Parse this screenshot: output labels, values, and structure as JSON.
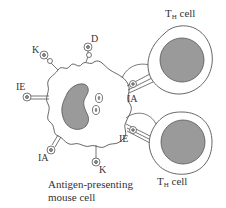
{
  "diagram": {
    "apc_caption_line1": "Antigen-presenting",
    "apc_caption_line2": "mouse cell",
    "th_cell_top": {
      "main": "T",
      "sub": "H",
      "suffix": " cell"
    },
    "th_cell_bottom": {
      "main": "T",
      "sub": "H",
      "suffix": " cell"
    },
    "molecule_labels": {
      "k_top": "K",
      "d_top": "D",
      "ie_left": "IE",
      "ia_left": "IA",
      "k_bottom": "K",
      "ia_right": "IA",
      "ie_right": "IE"
    },
    "colors": {
      "nucleus": "#9a9a9a",
      "outline": "#444444",
      "background": "#ffffff"
    }
  }
}
